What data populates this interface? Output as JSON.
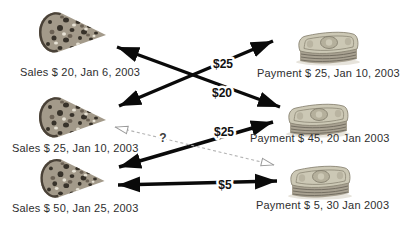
{
  "diagram": {
    "sales": [
      {
        "icon": "pizza-slice-icon",
        "label": "Sales $ 20, Jan 6, 2003"
      },
      {
        "icon": "pizza-slice-icon",
        "label": "Sales $ 25, Jan 10, 2003"
      },
      {
        "icon": "pizza-slice-icon",
        "label": "Sales $ 50, Jan 25, 2003"
      }
    ],
    "payments": [
      {
        "icon": "money-stack-icon",
        "label": "Payment $ 25, Jan 10, 2003"
      },
      {
        "icon": "money-stack-icon",
        "label": "Payment $ 45, 20 Jan 2003"
      },
      {
        "icon": "money-stack-icon",
        "label": "Payment $ 5, 30 Jan 2003"
      }
    ],
    "links": [
      {
        "from": "sales-1",
        "to": "payment-2",
        "amount": "$20",
        "style": "solid-double-arrow"
      },
      {
        "from": "sales-2",
        "to": "payment-1",
        "amount": "$25",
        "style": "solid-double-arrow"
      },
      {
        "from": "sales-3",
        "to": "payment-2",
        "amount": "$25",
        "style": "solid-double-arrow"
      },
      {
        "from": "sales-3",
        "to": "payment-3",
        "amount": "$5",
        "style": "solid-double-arrow"
      },
      {
        "from": "sales-2",
        "to": "payment-3",
        "amount": "?",
        "style": "dashed-double-arrow"
      }
    ],
    "colors": {
      "arrow": "#0a0a0a",
      "dashed_arrow": "#b3b3b3",
      "label_text": "#2e2e2e",
      "background": "#ffffff"
    }
  }
}
